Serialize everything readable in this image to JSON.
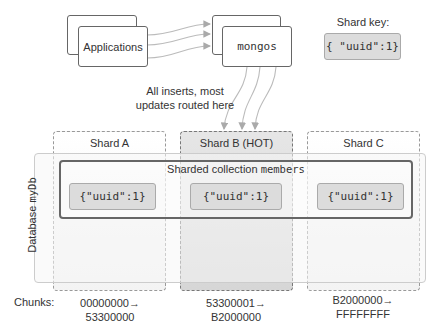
{
  "clients": {
    "label": "Applications"
  },
  "router": {
    "label": "mongos"
  },
  "shard_key": {
    "title": "Shard key:",
    "value": "{ \"uuid\":1}"
  },
  "routing_note": {
    "line1": "All inserts, most",
    "line2": "updates routed here"
  },
  "database": {
    "label_prefix": "Database ",
    "name": "myDb"
  },
  "collection": {
    "label_prefix": "Sharded collection ",
    "name": "members"
  },
  "shards": [
    {
      "name": "Shard A",
      "hot": false,
      "key": "{\"uuid\":1}",
      "chunk_start": "00000000→",
      "chunk_end": "53300000"
    },
    {
      "name": "Shard B (HOT)",
      "hot": true,
      "key": "{\"uuid\":1}",
      "chunk_start": "53300001→",
      "chunk_end": "B2000000"
    },
    {
      "name": "Shard C",
      "hot": false,
      "key": "{\"uuid\":1}",
      "chunk_start": "B2000000→",
      "chunk_end": "FFFFFFFF"
    }
  ],
  "chunks_label": "Chunks:",
  "colors": {
    "hot_fill": "#d9d9d9",
    "key_fill": "#dcdcdc",
    "border": "#666666",
    "dashed": "#999999"
  }
}
